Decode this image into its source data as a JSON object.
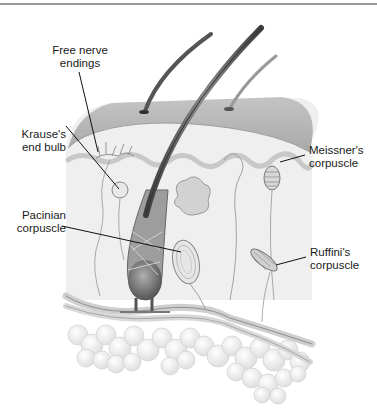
{
  "figure": {
    "labels": {
      "free_nerve_endings": {
        "line1": "Free nerve",
        "line2": "endings"
      },
      "krause": {
        "line1": "Krause's",
        "line2": "end bulb"
      },
      "pacinian": {
        "line1": "Pacinian",
        "line2": "corpuscle"
      },
      "meissner": {
        "line1": "Meissner's",
        "line2": "corpuscle"
      },
      "ruffini": {
        "line1": "Ruffini's",
        "line2": "corpuscle"
      }
    }
  },
  "colors": {
    "rule": "#9a9a9a",
    "epidermis": "#bdbdbd",
    "dermis": "#ececec",
    "hair": "#555555",
    "fat": "#f0f0f0",
    "leader": "#111111"
  }
}
